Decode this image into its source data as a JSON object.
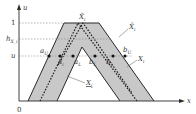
{
  "diagram": {
    "type": "fuzzy-interval-type2-membership",
    "axes": {
      "y_label": "u",
      "x_label": "x",
      "origin_label": "0"
    },
    "y_ticks": [
      {
        "label": "1",
        "y": 23
      },
      {
        "label": "h",
        "sub": "X_i",
        "y": 39
      },
      {
        "label": "u",
        "y": 56
      }
    ],
    "functions": [
      {
        "name": "upper",
        "label": "X̄",
        "sub": "i",
        "desc": "upper membership function (outer boundary)"
      },
      {
        "name": "principal",
        "label": "X",
        "sub": "i",
        "desc": "dotted principal membership function"
      },
      {
        "name": "lower",
        "label": "X",
        "sub": "i",
        "underline": true,
        "desc": "lower membership function (inner boundary)"
      }
    ],
    "top_label": {
      "text": "X̃",
      "sub": "i"
    },
    "alpha_cut_points": [
      {
        "label": "a",
        "sub": "U"
      },
      {
        "label": "a",
        "sub": "i"
      },
      {
        "label": "a",
        "sub": "L"
      },
      {
        "label": "b",
        "sub": "L"
      },
      {
        "label": "b",
        "sub": "i"
      },
      {
        "label": "b",
        "sub": "U"
      }
    ],
    "colors": {
      "band_fill": "#c8c8c8",
      "line": "#2a2a2a",
      "guide": "#888888",
      "background": "#ffffff"
    }
  }
}
